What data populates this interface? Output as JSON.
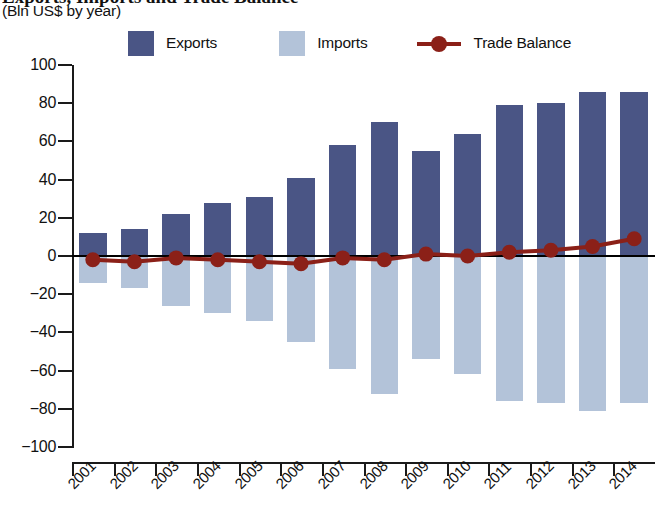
{
  "title": {
    "main_cropped": "Exports, Imports and Trade Balance",
    "subtitle": "(Bln US$ by year)"
  },
  "legend": {
    "position": "top",
    "items": [
      {
        "label": "Exports",
        "color": "#4a5585",
        "marker": "square",
        "icon": "square-swatch-icon"
      },
      {
        "label": "Imports",
        "color": "#b3c3d9",
        "marker": "square",
        "icon": "square-swatch-icon"
      },
      {
        "label": "Trade Balance",
        "color": "#8b2018",
        "marker": "line-circle",
        "icon": "line-marker-icon"
      }
    ]
  },
  "axes": {
    "y_ticks": [
      "100",
      "80",
      "60",
      "40",
      "20",
      "0",
      "-20",
      "-40",
      "-60",
      "-80",
      "-100"
    ],
    "y_values": [
      100,
      80,
      60,
      40,
      20,
      0,
      -20,
      -40,
      -60,
      -80,
      -100
    ],
    "x_ticks": [
      "2001",
      "2002",
      "2003",
      "2004",
      "2005",
      "2006",
      "2007",
      "2008",
      "2009",
      "2010",
      "2011",
      "2012",
      "2013",
      "2014"
    ]
  },
  "chart_data": {
    "type": "bar",
    "title": "Exports, Imports and Trade Balance",
    "subtitle": "(Bln US$ by year)",
    "xlabel": "",
    "ylabel": "Bln US$",
    "ylim": [
      -100,
      100
    ],
    "ytick_step": 20,
    "grid": false,
    "legend_position": "top",
    "zero_line": true,
    "categories": [
      "2001",
      "2002",
      "2003",
      "2004",
      "2005",
      "2006",
      "2007",
      "2008",
      "2009",
      "2010",
      "2011",
      "2012",
      "2013",
      "2014"
    ],
    "series": [
      {
        "name": "Exports",
        "type": "bar",
        "color": "#4a5585",
        "values": [
          12,
          14,
          22,
          28,
          31,
          41,
          58,
          70,
          55,
          64,
          79,
          80,
          86,
          86
        ]
      },
      {
        "name": "Imports",
        "type": "bar",
        "color": "#b3c3d9",
        "note": "plotted as negative values below the zero line",
        "values": [
          -14,
          -17,
          -26,
          -30,
          -34,
          -45,
          -59,
          -72,
          -54,
          -62,
          -76,
          -77,
          -81,
          -77
        ]
      },
      {
        "name": "Trade Balance",
        "type": "line",
        "color": "#8b2018",
        "marker": "circle",
        "values": [
          -2,
          -3,
          -1,
          -2,
          -3,
          -4,
          -1,
          -2,
          1,
          0,
          2,
          3,
          5,
          9
        ]
      }
    ]
  }
}
